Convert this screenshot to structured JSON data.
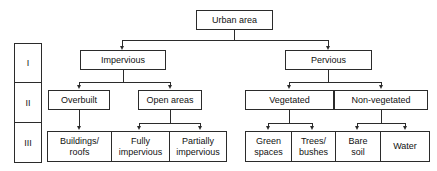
{
  "diagram": {
    "level_column": {
      "name": "level-column",
      "levels": [
        {
          "label": "I"
        },
        {
          "label": "II"
        },
        {
          "label": "III"
        }
      ]
    },
    "root": {
      "label": "Urban area"
    },
    "level_1": [
      {
        "label": "Impervious"
      },
      {
        "label": "Pervious"
      }
    ],
    "level_2": [
      {
        "label": "Overbuilt"
      },
      {
        "label": "Open areas"
      },
      {
        "label": "Vegetated"
      },
      {
        "label": "Non-vegetated"
      }
    ],
    "level_3": [
      {
        "label": "Buildings/\nroofs",
        "line1": "Buildings/",
        "line2": "roofs"
      },
      {
        "label": "Fully impervious",
        "line1": "Fully",
        "line2": "impervious"
      },
      {
        "label": "Partially impervious",
        "line1": "Partially",
        "line2": "impervious"
      },
      {
        "label": "Green spaces",
        "line1": "Green",
        "line2": "spaces"
      },
      {
        "label": "Trees/bushes",
        "line1": "Trees/",
        "line2": "bushes"
      },
      {
        "label": "Bare soil",
        "line1": "Bare",
        "line2": "soil"
      },
      {
        "label": "Water",
        "line1": "Water",
        "line2": ""
      }
    ],
    "colors": {
      "stroke": "#2b2b2b",
      "background": "#ffffff",
      "text": "#111111"
    }
  }
}
